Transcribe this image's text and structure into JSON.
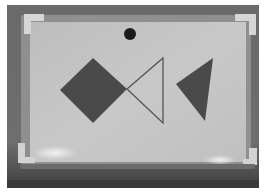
{
  "photo": {
    "description": "Grayscale photo of a small whiteboard with geometric shapes forming a fish-like arrangement",
    "colors": {
      "page_border": "#ffffff",
      "background_dark": "#585858",
      "frame": "#8f8f8f",
      "board_surface": "#c4c4c4",
      "corner_caps": "#d6d6d6",
      "shape_fill": "#4a4a4a",
      "outline_stroke": "#555555",
      "dot": "#1c1c1c",
      "glare": "#eeeeee"
    }
  },
  "shapes": {
    "dot": {
      "cx": 130,
      "cy": 34,
      "r": 6
    },
    "diamond": {
      "points": "93,58 127,89 93,123 60,90"
    },
    "outline_triangle": {
      "points": "127,89 163,58 163,123"
    },
    "filled_triangle": {
      "points": "213,58 205,121 176,84"
    }
  }
}
